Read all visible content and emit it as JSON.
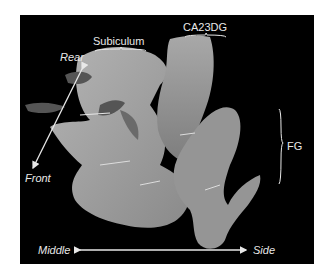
{
  "figure": {
    "background_color": "#000000",
    "annotation_color": "#e8e8e8",
    "structure_color": "#9a9a9a",
    "region_labels": {
      "subiculum": "Subiculum",
      "ca23dg": "CA23DG",
      "fg": "FG"
    },
    "axes": {
      "rear": "Rear",
      "front": "Front",
      "middle": "Middle",
      "side": "Side"
    }
  }
}
